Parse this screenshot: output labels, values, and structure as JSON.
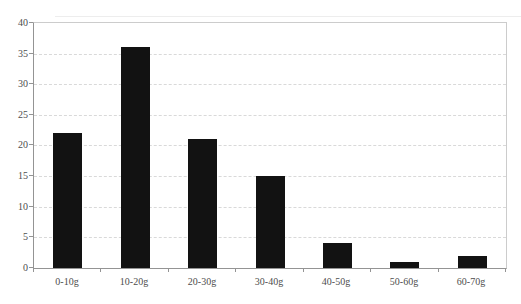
{
  "chart_data": {
    "type": "bar",
    "title": "",
    "xlabel": "",
    "ylabel": "",
    "categories": [
      "0-10g",
      "10-20g",
      "20-30g",
      "30-40g",
      "40-50g",
      "50-60g",
      "60-70g"
    ],
    "values": [
      22,
      36,
      21,
      15,
      4,
      1,
      2
    ],
    "ylim": [
      0,
      40
    ],
    "ytick_step": 5,
    "ytick_labels": [
      "0",
      "5",
      "10",
      "15",
      "20",
      "25",
      "30",
      "35",
      "40"
    ],
    "grid": "horizontal-dashed",
    "legend": "none",
    "colors": {
      "bar": "#121212",
      "axis": "#949494",
      "plot_border": "#cccccc",
      "gridline": "#d9d9d9",
      "tick_label": "#4d4d4d",
      "background": "#ffffff",
      "artifact_line": "#ededed"
    }
  }
}
